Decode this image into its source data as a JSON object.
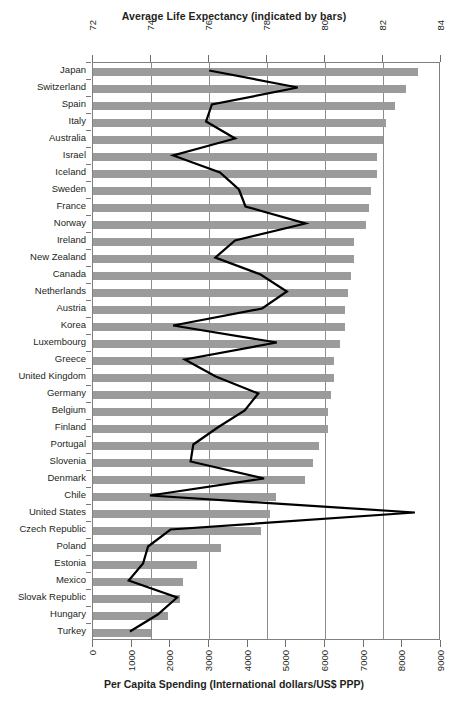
{
  "chart_data": {
    "type": "bar",
    "title": "Average Life Expectancy (indicated by bars)",
    "subtitle": "",
    "xlabel_top": "Average Life Expectancy (indicated by bars)",
    "xlabel_bottom": "Per Capita Spending (International dollars/US$ PPP)",
    "ylabel": "",
    "orientation": "horizontal",
    "grid": true,
    "legend": "none",
    "top_axis": {
      "name": "Average Life Expectancy (indicated by bars)",
      "ticks": [
        72,
        74,
        76,
        78,
        80,
        82,
        84
      ],
      "min": 72,
      "max": 84
    },
    "bottom_axis": {
      "name": "Per Capita Spending (International dollars/US$ PPP)",
      "ticks": [
        0,
        1000,
        2000,
        3000,
        4000,
        5000,
        6000,
        7000,
        8000,
        9000
      ],
      "min": 0,
      "max": 9000
    },
    "categories": [
      "Japan",
      "Switzerland",
      "Spain",
      "Italy",
      "Australia",
      "Israel",
      "Iceland",
      "Sweden",
      "France",
      "Norway",
      "Ireland",
      "New Zealand",
      "Canada",
      "Netherlands",
      "Austria",
      "Korea",
      "Luxembourg",
      "Greece",
      "United Kingdom",
      "Germany",
      "Belgium",
      "Finland",
      "Portugal",
      "Slovenia",
      "Denmark",
      "Chile",
      "United States",
      "Czech Republic",
      "Poland",
      "Estonia",
      "Mexico",
      "Slovak Republic",
      "Hungary",
      "Turkey"
    ],
    "series": [
      {
        "name": "Average Life Expectancy",
        "unit": "years",
        "render": "bar",
        "axis": "top",
        "values": [
          83.2,
          82.8,
          82.4,
          82.1,
          82.0,
          81.8,
          81.8,
          81.6,
          81.5,
          81.4,
          81.0,
          81.0,
          80.9,
          80.8,
          80.7,
          80.7,
          80.5,
          80.3,
          80.3,
          80.2,
          80.1,
          80.1,
          79.8,
          79.6,
          79.3,
          78.3,
          78.1,
          77.8,
          76.4,
          75.6,
          75.1,
          75.0,
          74.6,
          74.0
        ]
      },
      {
        "name": "Per Capita Spending",
        "unit": "International dollars/US$ PPP",
        "render": "line",
        "axis": "bottom",
        "values": [
          3030,
          5320,
          3100,
          2950,
          3700,
          2100,
          3310,
          3800,
          3970,
          5520,
          3700,
          3190,
          4360,
          5040,
          4400,
          2100,
          4780,
          2400,
          3200,
          4300,
          3950,
          3250,
          2620,
          2550,
          4450,
          1500,
          8350,
          2030,
          1450,
          1320,
          950,
          2200,
          1700,
          980
        ]
      }
    ],
    "line_color": "#000000",
    "bar_color": "#9b9b9b"
  }
}
